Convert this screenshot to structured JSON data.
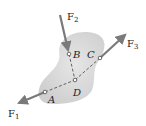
{
  "diagram": {
    "body_color": "#d9d9d9",
    "force_color": "#7a7a7a",
    "points": [
      {
        "id": "A",
        "label": "A",
        "x": 45,
        "y": 92
      },
      {
        "id": "B",
        "label": "B",
        "x": 69,
        "y": 54
      },
      {
        "id": "C",
        "label": "C",
        "x": 100,
        "y": 58
      },
      {
        "id": "D",
        "label": "D",
        "x": 75,
        "y": 80
      }
    ],
    "forces": [
      {
        "id": "F1",
        "label": "F",
        "sub": "1"
      },
      {
        "id": "F2",
        "label": "F",
        "sub": "2"
      },
      {
        "id": "F3",
        "label": "F",
        "sub": "3"
      }
    ]
  }
}
